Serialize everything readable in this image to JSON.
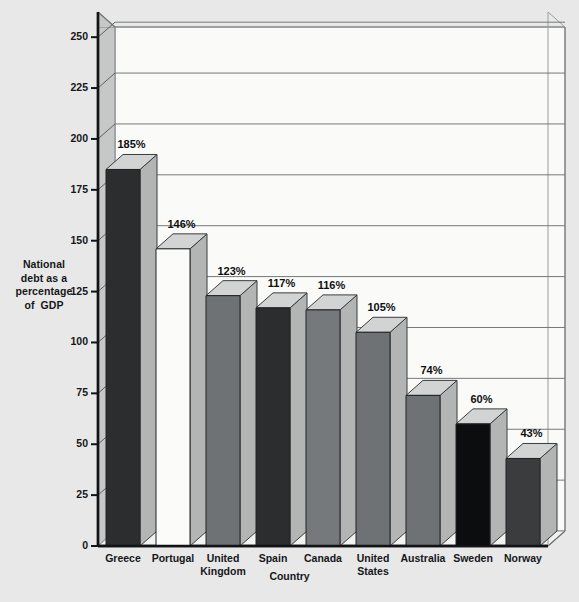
{
  "chart_data": {
    "type": "bar",
    "title": "",
    "xlabel": "Country",
    "ylabel": "National debt as a percentage of GDP",
    "ylabel_lines": [
      "National",
      "debt as a",
      "percentage",
      "of  GDP"
    ],
    "categories": [
      "Greece",
      "Portugal",
      "United Kingdom",
      "Spain",
      "Canada",
      "United States",
      "Australia",
      "Sweden",
      "Norway"
    ],
    "category_lines": [
      [
        "Greece"
      ],
      [
        "Portugal"
      ],
      [
        "United",
        "Kingdom"
      ],
      [
        "Spain"
      ],
      [
        "Canada"
      ],
      [
        "United",
        "States"
      ],
      [
        "Australia"
      ],
      [
        "Sweden"
      ],
      [
        "Norway"
      ]
    ],
    "values": [
      185,
      146,
      123,
      117,
      116,
      105,
      74,
      60,
      43
    ],
    "value_labels": [
      "185%",
      "146%",
      "123%",
      "117%",
      "116%",
      "105%",
      "74%",
      "60%",
      "43%"
    ],
    "bar_colors": [
      "#2b2d2f",
      "#fbfbfa",
      "#6f7274",
      "#2b2d2f",
      "#76797b",
      "#6f7274",
      "#6f7274",
      "#0c0d0e",
      "#3a3c3e"
    ],
    "ylim": [
      0,
      255
    ],
    "yticks": [
      0,
      25,
      50,
      75,
      100,
      125,
      150,
      175,
      200,
      225,
      250
    ],
    "ytick_labels": [
      "0",
      "25",
      "50",
      "75",
      "100",
      "125",
      "150",
      "175",
      "200",
      "225",
      "250"
    ],
    "grid": true,
    "legend": "none",
    "style": "3d-column",
    "units": "percent of GDP"
  },
  "colors": {
    "page_background": "#e8e8e8",
    "plot_floor": "#f2f2f0",
    "plot_back_wall": "#fafaf8",
    "side_wall": "#c6c8c7",
    "axis_line": "#111315",
    "grid_line": "#76797b",
    "bar_top": "#d2d4d3",
    "bar_side": "#b2b5b4",
    "text": "#15171a"
  }
}
